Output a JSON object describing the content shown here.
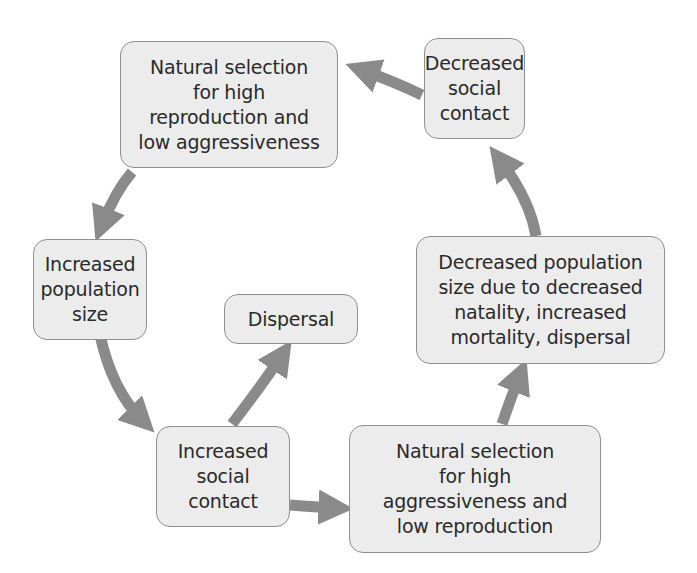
{
  "diagram": {
    "type": "cycle",
    "arrow_color": "#8a8a8a",
    "box_fill": "#ececec",
    "box_border": "#8f8f8f",
    "nodes": {
      "ns_high_reproduction": "Natural selection\nfor high\nreproduction and\nlow aggressiveness",
      "decreased_social_contact": "Decreased\nsocial\ncontact",
      "increased_population_size": "Increased\npopulation\nsize",
      "dispersal": "Dispersal",
      "decreased_population_size": "Decreased population\nsize due to decreased\nnatality, increased\nmortality, dispersal",
      "increased_social_contact": "Increased\nsocial\ncontact",
      "ns_high_aggressiveness": "Natural selection\nfor high\naggressiveness and\nlow reproduction"
    },
    "edges": [
      {
        "from": "Natural selection for high reproduction and low aggressiveness",
        "to": "Increased population size"
      },
      {
        "from": "Increased population size",
        "to": "Increased social contact"
      },
      {
        "from": "Increased social contact",
        "to": "Dispersal"
      },
      {
        "from": "Increased social contact",
        "to": "Natural selection for high aggressiveness and low reproduction"
      },
      {
        "from": "Natural selection for high aggressiveness and low reproduction",
        "to": "Decreased population size due to decreased natality, increased mortality, dispersal"
      },
      {
        "from": "Decreased population size due to decreased natality, increased mortality, dispersal",
        "to": "Decreased social contact"
      },
      {
        "from": "Decreased social contact",
        "to": "Natural selection for high reproduction and low aggressiveness"
      }
    ]
  }
}
